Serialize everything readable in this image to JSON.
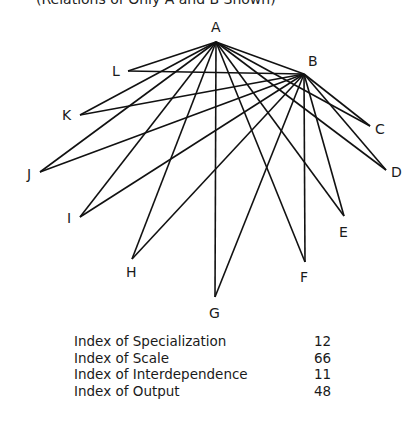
{
  "caption": "(Relations of Only A and B Shown)",
  "nodes": [
    {
      "id": "A",
      "x": 216,
      "y": 42,
      "lx": 211,
      "ly": 32
    },
    {
      "id": "B",
      "x": 304,
      "y": 74,
      "lx": 308,
      "ly": 66
    },
    {
      "id": "C",
      "x": 370,
      "y": 126,
      "lx": 375,
      "ly": 134
    },
    {
      "id": "D",
      "x": 386,
      "y": 170,
      "lx": 391,
      "ly": 177
    },
    {
      "id": "E",
      "x": 344,
      "y": 216,
      "lx": 339,
      "ly": 237
    },
    {
      "id": "F",
      "x": 305,
      "y": 262,
      "lx": 300,
      "ly": 282
    },
    {
      "id": "G",
      "x": 215,
      "y": 297,
      "lx": 209,
      "ly": 318
    },
    {
      "id": "H",
      "x": 132,
      "y": 259,
      "lx": 126,
      "ly": 277
    },
    {
      "id": "I",
      "x": 80,
      "y": 217,
      "lx": 67,
      "ly": 223
    },
    {
      "id": "J",
      "x": 40,
      "y": 172,
      "lx": 27,
      "ly": 179
    },
    {
      "id": "K",
      "x": 80,
      "y": 115,
      "lx": 62,
      "ly": 120
    },
    {
      "id": "L",
      "x": 128,
      "y": 71,
      "lx": 112,
      "ly": 76
    }
  ],
  "edges_from": [
    "A",
    "B"
  ],
  "table": [
    {
      "label": "Index of Specialization",
      "value": "12"
    },
    {
      "label": "Index of Scale",
      "value": "66"
    },
    {
      "label": "Index of Interdependence",
      "value": "11"
    },
    {
      "label": "Index of Output",
      "value": "48"
    }
  ]
}
